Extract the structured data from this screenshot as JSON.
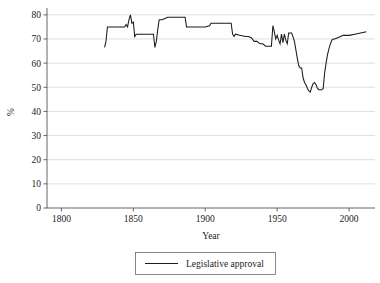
{
  "chart_data": {
    "type": "line",
    "title": "",
    "xlabel": "Year",
    "ylabel": "%",
    "xlim": [
      1790,
      2018
    ],
    "ylim": [
      0,
      82
    ],
    "grid": true,
    "grid_axis": "y",
    "legend_position": "bottom-center",
    "xticks": [
      1800,
      1850,
      1900,
      1950,
      2000
    ],
    "xtick_labels": [
      "1800",
      "1850",
      "1900",
      "1950",
      "2000"
    ],
    "yticks": [
      0,
      10,
      20,
      30,
      40,
      50,
      60,
      70,
      80
    ],
    "ytick_labels": [
      "0",
      "10",
      "20",
      "30",
      "40",
      "50",
      "60",
      "70",
      "80"
    ],
    "series": [
      {
        "name": "Legislative approval",
        "color": "#1a1a1a",
        "x": [
          1830,
          1831,
          1832,
          1833,
          1834,
          1836,
          1840,
          1844,
          1845,
          1846,
          1847,
          1848,
          1849,
          1850,
          1851,
          1852,
          1856,
          1860,
          1863,
          1864,
          1865,
          1866,
          1867,
          1868,
          1870,
          1872,
          1874,
          1876,
          1880,
          1884,
          1886,
          1887,
          1888,
          1892,
          1896,
          1900,
          1903,
          1904,
          1908,
          1912,
          1916,
          1918,
          1919,
          1920,
          1921,
          1924,
          1928,
          1930,
          1932,
          1934,
          1936,
          1938,
          1940,
          1942,
          1944,
          1945,
          1946,
          1947,
          1948,
          1949,
          1950,
          1951,
          1952,
          1953,
          1954,
          1955,
          1956,
          1957,
          1958,
          1959,
          1960,
          1961,
          1962,
          1963,
          1964,
          1965,
          1966,
          1967,
          1968,
          1969,
          1970,
          1971,
          1972,
          1973,
          1974,
          1975,
          1976,
          1977,
          1978,
          1979,
          1980,
          1981,
          1982,
          1983,
          1984,
          1985,
          1986,
          1987,
          1988,
          1989,
          1990,
          1992,
          1994,
          1996,
          2000,
          2004,
          2008,
          2012
        ],
        "y": [
          66.5,
          69.0,
          75.0,
          75.0,
          75.0,
          75.0,
          75.0,
          75.0,
          76.0,
          75.0,
          78.0,
          80.0,
          76.5,
          77.0,
          71.0,
          72.0,
          72.0,
          72.0,
          72.0,
          72.0,
          66.5,
          69.0,
          74.0,
          78.0,
          78.0,
          78.5,
          79.0,
          79.0,
          79.0,
          79.0,
          79.0,
          75.0,
          75.0,
          75.0,
          75.0,
          75.0,
          75.5,
          76.5,
          76.5,
          76.5,
          76.5,
          76.5,
          72.0,
          71.0,
          72.0,
          71.5,
          71.0,
          71.0,
          70.5,
          69.0,
          69.0,
          68.0,
          68.0,
          67.0,
          67.0,
          67.0,
          67.0,
          75.5,
          73.0,
          70.0,
          71.5,
          69.5,
          68.0,
          72.0,
          68.5,
          72.0,
          69.5,
          68.0,
          72.5,
          72.5,
          72.5,
          71.0,
          69.0,
          65.5,
          62.0,
          59.0,
          58.0,
          58.0,
          54.0,
          52.0,
          51.0,
          49.5,
          48.5,
          48.0,
          50.0,
          51.5,
          52.0,
          51.0,
          49.5,
          49.0,
          49.0,
          49.0,
          49.5,
          56.0,
          60.0,
          63.5,
          66.0,
          68.0,
          69.5,
          70.0,
          70.0,
          70.5,
          71.0,
          71.5,
          71.5,
          72.0,
          72.5,
          73.0
        ]
      }
    ]
  },
  "legend": {
    "entries": [
      {
        "label": "Legislative approval"
      }
    ]
  },
  "axes": {
    "x_title": "Year",
    "y_title": "%"
  }
}
